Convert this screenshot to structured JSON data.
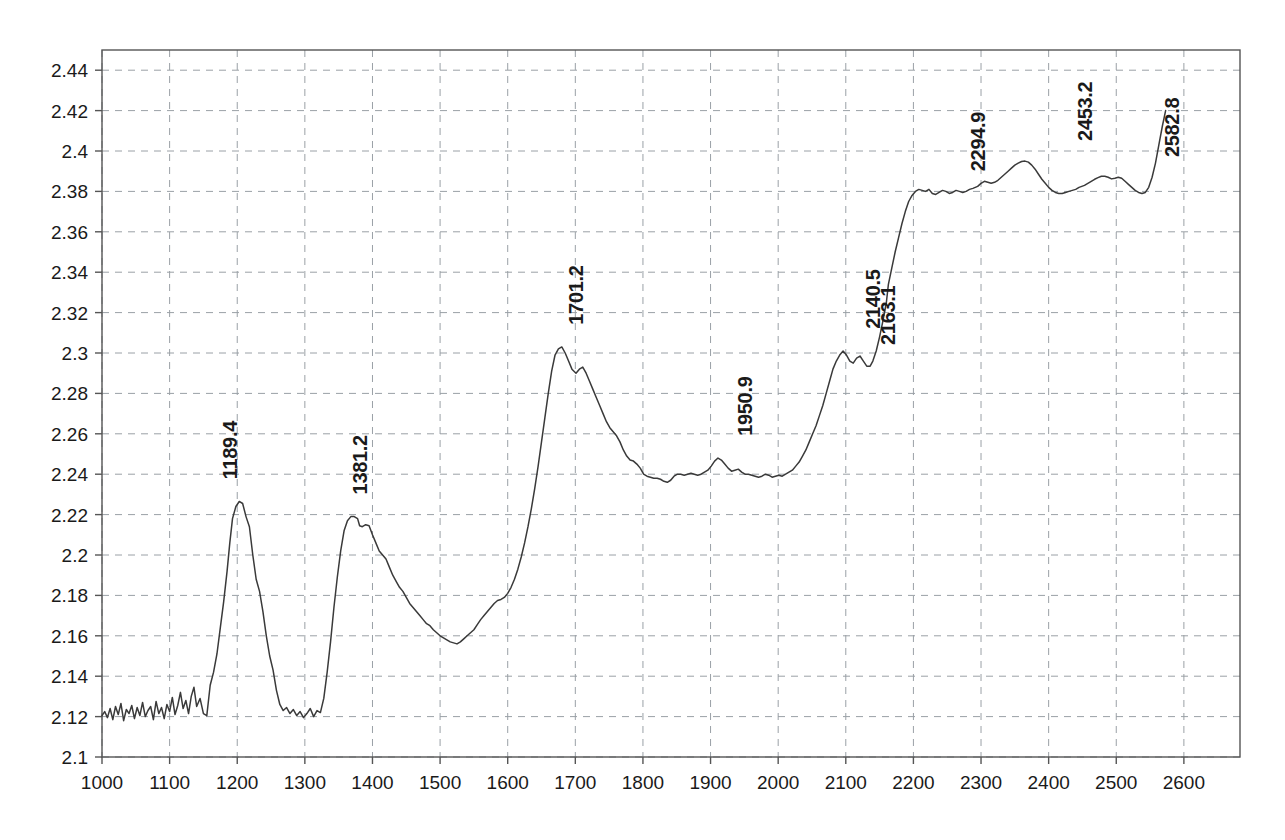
{
  "chart_data": {
    "type": "line",
    "title": "",
    "subtitle": "",
    "xlabel": "",
    "ylabel": "",
    "xlim": [
      1000,
      2683
    ],
    "ylim": [
      2.1,
      2.45
    ],
    "grid": true,
    "legend": null,
    "legend_position": "none",
    "line_color": "#3a3a3a",
    "grid_color": "#9aa0a6",
    "axis_color": "#555555",
    "background": "#ffffff",
    "xticks": [
      1000,
      1100,
      1200,
      1300,
      1400,
      1500,
      1600,
      1700,
      1800,
      1900,
      2000,
      2100,
      2200,
      2300,
      2400,
      2500,
      2600
    ],
    "xtick_labels": [
      "1000",
      "1100",
      "1200",
      "1300",
      "1400",
      "1500",
      "1600",
      "1700",
      "1800",
      "1900",
      "2000",
      "2100",
      "2200",
      "2300",
      "2400",
      "2500",
      "2600"
    ],
    "yticks": [
      2.1,
      2.12,
      2.14,
      2.16,
      2.18,
      2.2,
      2.22,
      2.24,
      2.26,
      2.28,
      2.3,
      2.32,
      2.34,
      2.36,
      2.38,
      2.4,
      2.42,
      2.44
    ],
    "ytick_labels": [
      "2.1",
      "2.12",
      "2.14",
      "2.16",
      "2.18",
      "2.2",
      "2.22",
      "2.24",
      "2.26",
      "2.28",
      "2.3",
      "2.32",
      "2.34",
      "2.36",
      "2.38",
      "2.4",
      "2.42",
      "2.44"
    ],
    "annotations": [
      {
        "label": "1189.4",
        "x": 1189.4,
        "y": 2.2265,
        "label_y": 2.2355,
        "rotation": -90
      },
      {
        "label": "1381.2",
        "x": 1381.2,
        "y": 2.219,
        "label_y": 2.228,
        "rotation": -90
      },
      {
        "label": "1701.2",
        "x": 1701.2,
        "y": 2.303,
        "label_y": 2.312,
        "rotation": -90
      },
      {
        "label": "1950.9",
        "x": 1950.9,
        "y": 2.248,
        "label_y": 2.257,
        "rotation": -90
      },
      {
        "label": "2140.5",
        "x": 2140.5,
        "y": 2.301,
        "label_y": 2.31,
        "rotation": -90
      },
      {
        "label": "2163.1",
        "x": 2163.1,
        "y": 2.2985,
        "label_y": 2.302,
        "rotation": -90
      },
      {
        "label": "2294.9",
        "x": 2294.9,
        "y": 2.381,
        "label_y": 2.388,
        "rotation": -90
      },
      {
        "label": "2453.2",
        "x": 2453.2,
        "y": 2.395,
        "label_y": 2.403,
        "rotation": -90
      },
      {
        "label": "2582.8",
        "x": 2582.8,
        "y": 2.3875,
        "label_y": 2.395,
        "rotation": -90
      }
    ],
    "x": [
      1000,
      1004,
      1008,
      1012,
      1016,
      1020,
      1024,
      1028,
      1032,
      1036,
      1040,
      1044,
      1048,
      1052,
      1056,
      1060,
      1064,
      1068,
      1072,
      1076,
      1080,
      1084,
      1088,
      1092,
      1096,
      1100,
      1104,
      1108,
      1112,
      1116,
      1120,
      1124,
      1128,
      1132,
      1136,
      1140,
      1145,
      1150,
      1155,
      1160,
      1165,
      1170,
      1175,
      1180,
      1185,
      1189,
      1193,
      1198,
      1203,
      1208,
      1213,
      1218,
      1223,
      1228,
      1233,
      1238,
      1243,
      1248,
      1253,
      1258,
      1263,
      1268,
      1273,
      1278,
      1283,
      1288,
      1293,
      1298,
      1303,
      1308,
      1313,
      1318,
      1323,
      1328,
      1333,
      1338,
      1343,
      1348,
      1353,
      1358,
      1363,
      1368,
      1373,
      1378,
      1381,
      1385,
      1390,
      1395,
      1400,
      1405,
      1410,
      1415,
      1420,
      1425,
      1430,
      1435,
      1440,
      1445,
      1450,
      1455,
      1460,
      1465,
      1470,
      1475,
      1480,
      1485,
      1490,
      1495,
      1500,
      1505,
      1510,
      1515,
      1520,
      1525,
      1530,
      1535,
      1540,
      1545,
      1550,
      1555,
      1560,
      1565,
      1570,
      1575,
      1580,
      1585,
      1590,
      1595,
      1600,
      1605,
      1610,
      1615,
      1620,
      1625,
      1630,
      1635,
      1640,
      1645,
      1650,
      1655,
      1660,
      1665,
      1670,
      1675,
      1680,
      1685,
      1690,
      1695,
      1701,
      1706,
      1711,
      1716,
      1721,
      1726,
      1731,
      1736,
      1741,
      1746,
      1751,
      1756,
      1761,
      1766,
      1771,
      1776,
      1781,
      1786,
      1791,
      1796,
      1801,
      1806,
      1811,
      1816,
      1821,
      1826,
      1831,
      1836,
      1841,
      1846,
      1851,
      1856,
      1861,
      1866,
      1871,
      1876,
      1881,
      1886,
      1891,
      1896,
      1901,
      1906,
      1911,
      1916,
      1921,
      1926,
      1931,
      1936,
      1941,
      1946,
      1951,
      1956,
      1961,
      1966,
      1971,
      1976,
      1981,
      1986,
      1991,
      1996,
      2001,
      2006,
      2011,
      2016,
      2021,
      2026,
      2031,
      2036,
      2041,
      2046,
      2051,
      2056,
      2061,
      2066,
      2071,
      2076,
      2081,
      2086,
      2091,
      2096,
      2101,
      2106,
      2111,
      2116,
      2121,
      2126,
      2131,
      2136,
      2140,
      2145,
      2150,
      2155,
      2160,
      2163,
      2168,
      2173,
      2178,
      2183,
      2188,
      2193,
      2198,
      2203,
      2208,
      2213,
      2218,
      2223,
      2228,
      2233,
      2238,
      2243,
      2248,
      2253,
      2258,
      2263,
      2268,
      2273,
      2278,
      2283,
      2288,
      2295,
      2300,
      2305,
      2310,
      2315,
      2320,
      2325,
      2330,
      2335,
      2340,
      2345,
      2350,
      2355,
      2360,
      2365,
      2370,
      2375,
      2380,
      2385,
      2390,
      2395,
      2400,
      2405,
      2410,
      2415,
      2420,
      2425,
      2430,
      2435,
      2440,
      2445,
      2453,
      2458,
      2463,
      2468,
      2473,
      2478,
      2483,
      2488,
      2493,
      2498,
      2503,
      2508,
      2513,
      2518,
      2523,
      2528,
      2533,
      2538,
      2543,
      2548,
      2553,
      2558,
      2563,
      2568,
      2573,
      2578,
      2583,
      2588,
      2593,
      2598,
      2603,
      2608,
      2613,
      2618,
      2623,
      2628,
      2633,
      2638,
      2643,
      2648,
      2653,
      2658,
      2663,
      2668,
      2673,
      2678,
      2683
    ],
    "y": [
      2.1205,
      2.1225,
      2.1195,
      2.124,
      2.1185,
      2.125,
      2.121,
      2.1265,
      2.118,
      2.1235,
      2.1215,
      2.1255,
      2.119,
      2.1245,
      2.1205,
      2.127,
      2.12,
      2.123,
      2.125,
      2.1185,
      2.1275,
      2.1215,
      2.1245,
      2.119,
      2.126,
      2.1225,
      2.1295,
      2.121,
      2.1255,
      2.132,
      2.124,
      2.128,
      2.1215,
      2.13,
      2.1345,
      2.125,
      2.129,
      2.1215,
      2.1205,
      2.1355,
      2.142,
      2.151,
      2.164,
      2.177,
      2.192,
      2.206,
      2.218,
      2.224,
      2.2265,
      2.2255,
      2.219,
      2.214,
      2.2,
      2.188,
      2.182,
      2.172,
      2.16,
      2.15,
      2.143,
      2.133,
      2.126,
      2.123,
      2.1245,
      2.1215,
      2.1235,
      2.1205,
      2.1225,
      2.1195,
      2.1215,
      2.124,
      2.12,
      2.123,
      2.122,
      2.129,
      2.142,
      2.157,
      2.174,
      2.189,
      2.202,
      2.212,
      2.217,
      2.219,
      2.219,
      2.218,
      2.2145,
      2.214,
      2.215,
      2.2145,
      2.21,
      2.206,
      2.202,
      2.2,
      2.198,
      2.194,
      2.19,
      2.187,
      2.184,
      2.182,
      2.179,
      2.176,
      2.174,
      2.172,
      2.17,
      2.168,
      2.166,
      2.165,
      2.163,
      2.1615,
      2.16,
      2.159,
      2.158,
      2.157,
      2.1565,
      2.156,
      2.157,
      2.1585,
      2.16,
      2.1615,
      2.163,
      2.1655,
      2.168,
      2.17,
      2.172,
      2.174,
      2.176,
      2.1775,
      2.178,
      2.179,
      2.181,
      2.184,
      2.188,
      2.193,
      2.199,
      2.206,
      2.214,
      2.223,
      2.233,
      2.244,
      2.256,
      2.268,
      2.28,
      2.291,
      2.299,
      2.302,
      2.303,
      2.3,
      2.296,
      2.292,
      2.29,
      2.292,
      2.293,
      2.29,
      2.286,
      2.282,
      2.278,
      2.274,
      2.27,
      2.266,
      2.263,
      2.261,
      2.259,
      2.256,
      2.252,
      2.249,
      2.247,
      2.2465,
      2.245,
      2.243,
      2.24,
      2.239,
      2.2385,
      2.238,
      2.238,
      2.2375,
      2.2365,
      2.236,
      2.237,
      2.239,
      2.24,
      2.24,
      2.2395,
      2.24,
      2.2405,
      2.24,
      2.2395,
      2.24,
      2.241,
      2.242,
      2.244,
      2.2465,
      2.248,
      2.247,
      2.245,
      2.243,
      2.2415,
      2.242,
      2.2425,
      2.241,
      2.24,
      2.24,
      2.2395,
      2.239,
      2.2385,
      2.239,
      2.24,
      2.2395,
      2.2385,
      2.239,
      2.2395,
      2.239,
      2.24,
      2.241,
      2.242,
      2.244,
      2.246,
      2.249,
      2.252,
      2.256,
      2.26,
      2.264,
      2.269,
      2.274,
      2.28,
      2.286,
      2.292,
      2.296,
      2.299,
      2.301,
      2.299,
      2.296,
      2.295,
      2.2975,
      2.2985,
      2.296,
      2.2935,
      2.2935,
      2.296,
      2.301,
      2.308,
      2.316,
      2.325,
      2.334,
      2.342,
      2.35,
      2.357,
      2.364,
      2.37,
      2.375,
      2.378,
      2.38,
      2.381,
      2.3805,
      2.38,
      2.381,
      2.379,
      2.3785,
      2.3795,
      2.3805,
      2.38,
      2.379,
      2.3795,
      2.3805,
      2.38,
      2.3795,
      2.38,
      2.381,
      2.3815,
      2.3825,
      2.384,
      2.385,
      2.3845,
      2.384,
      2.3845,
      2.3855,
      2.387,
      2.3885,
      2.39,
      2.3915,
      2.393,
      2.394,
      2.3948,
      2.395,
      2.3945,
      2.393,
      2.391,
      2.3885,
      2.386,
      2.384,
      2.382,
      2.3805,
      2.3795,
      2.379,
      2.379,
      2.3795,
      2.38,
      2.3805,
      2.381,
      2.382,
      2.383,
      2.384,
      2.385,
      2.386,
      2.3868,
      2.3875,
      2.3875,
      2.387,
      2.3862,
      2.3865,
      2.387,
      2.3865,
      2.385,
      2.3835,
      2.382,
      2.3805,
      2.3795,
      2.379,
      2.3795,
      2.382,
      2.387,
      2.394,
      2.403,
      2.412,
      2.42
    ]
  }
}
